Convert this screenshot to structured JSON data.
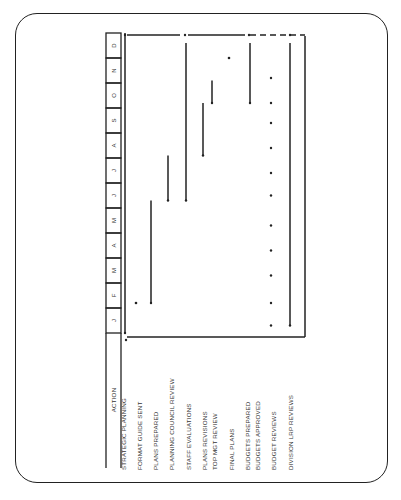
{
  "chart_data": {
    "type": "gantt",
    "orientation": "rotated 90 degrees counter-clockwise",
    "header": "ACTION",
    "months": [
      "J",
      "F",
      "M",
      "A",
      "M",
      "J",
      "J",
      "A",
      "S",
      "O",
      "N",
      "D"
    ],
    "rows": [
      {
        "label": "STRATEGIC PLANNING",
        "kind": "line",
        "start": 0.0,
        "end": 12.0
      },
      {
        "label": "FORMAT GUIDE SENT",
        "kind": "dot",
        "at": 1.2
      },
      {
        "label": "PLANS PREPARED",
        "kind": "line",
        "start": 1.2,
        "end": 5.3
      },
      {
        "label": "PLANNING COUNCIL REVIEW",
        "kind": "line",
        "start": 5.3,
        "end": 7.1
      },
      {
        "label": "STAFF EVALUATIONS",
        "kind": "line",
        "start": 5.3,
        "end": 11.6
      },
      {
        "label": "PLANS REVISIONS",
        "kind": "line",
        "start": 7.1,
        "end": 9.2
      },
      {
        "label": "TOP MGT REVIEW",
        "kind": "line",
        "start": 9.2,
        "end": 10.1
      },
      {
        "label": "FINAL PLANS",
        "kind": "dot",
        "at": 11.0
      },
      {
        "label": "BUDGETS PREPARED",
        "kind": "line",
        "start": 9.2,
        "end": 11.6
      },
      {
        "label": "BUDGETS APPROVED",
        "kind": "dots",
        "at": [
          0.3,
          1.2,
          2.3,
          3.3,
          4.3,
          5.5,
          6.4,
          7.4,
          8.4,
          9.2,
          10.2
        ]
      },
      {
        "label": "BUDGET REVIEWS",
        "kind": "dashed-boundary"
      },
      {
        "label": "DIVISION LRP REVIEWS",
        "kind": "line",
        "start": 0.3,
        "end": 11.6
      }
    ]
  },
  "layout": {
    "month_axis_x": 106,
    "month_axis_w": 15,
    "y_start": 333,
    "month_h": 25,
    "label_y": 470,
    "row_x": [
      125,
      136,
      151,
      168,
      186,
      203,
      212,
      229,
      250,
      271,
      271,
      290
    ],
    "label_x": [
      124,
      140,
      156,
      172,
      189,
      205,
      215,
      232,
      248,
      258,
      274,
      291
    ]
  }
}
